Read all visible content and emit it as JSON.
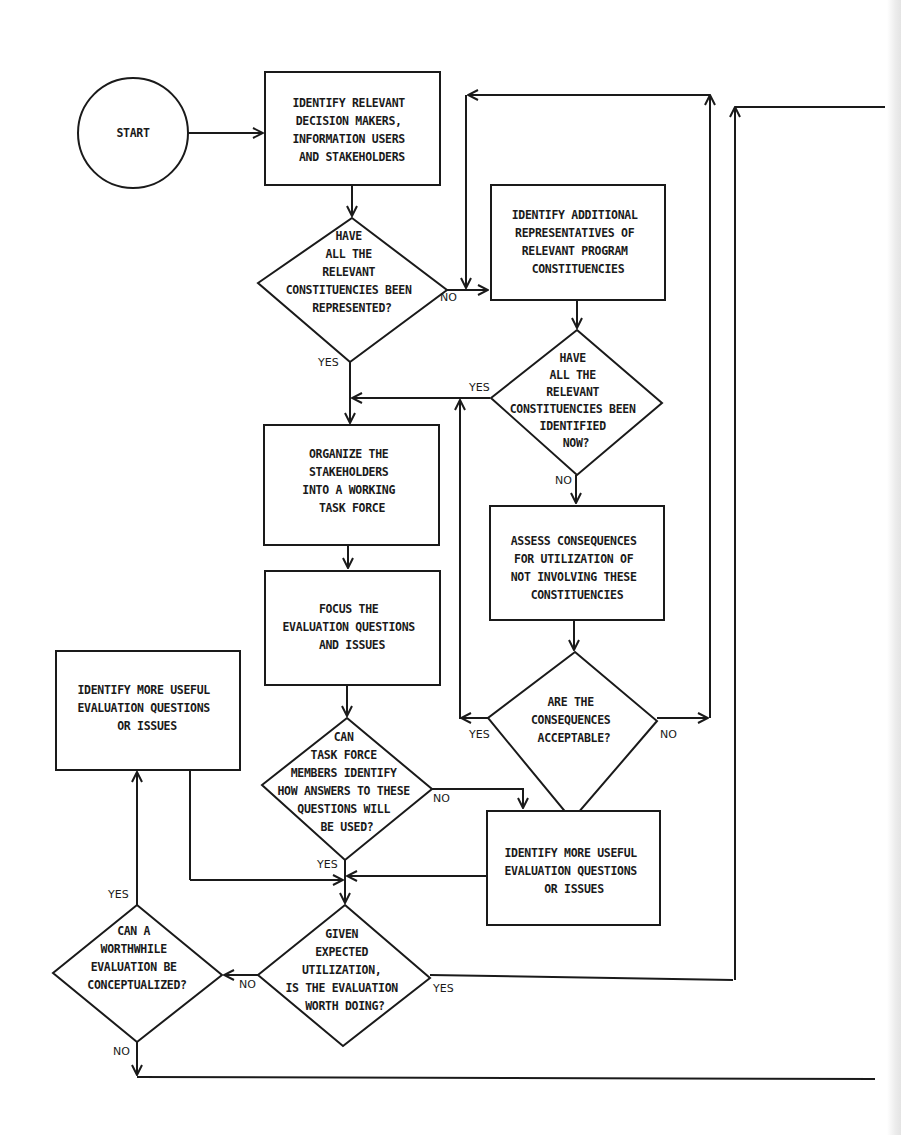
{
  "diagram": {
    "type": "flowchart",
    "colors": {
      "stroke": "#1a1a1a",
      "background": "#ffffff"
    },
    "nodes": {
      "start": {
        "shape": "circle",
        "lines": [
          "START"
        ]
      },
      "identify_stakeholders": {
        "shape": "box",
        "lines": [
          "IDENTIFY RELEVANT",
          "DECISION MAKERS,",
          "INFORMATION USERS",
          "AND STAKEHOLDERS"
        ]
      },
      "all_represented": {
        "shape": "diamond",
        "lines": [
          "HAVE",
          "ALL THE",
          "RELEVANT",
          "CONSTITUENCIES BEEN",
          "REPRESENTED?"
        ]
      },
      "identify_additional": {
        "shape": "box",
        "lines": [
          "IDENTIFY ADDITIONAL",
          "REPRESENTATIVES OF",
          "RELEVANT PROGRAM",
          "CONSTITUENCIES"
        ]
      },
      "all_identified": {
        "shape": "diamond",
        "lines": [
          "HAVE",
          "ALL THE",
          "RELEVANT",
          "CONSTITUENCIES BEEN",
          "IDENTIFIED",
          "NOW?"
        ]
      },
      "assess_consequences": {
        "shape": "box",
        "lines": [
          "ASSESS CONSEQUENCES",
          "FOR UTILIZATION OF",
          "NOT INVOLVING THESE",
          "CONSTITUENCIES"
        ]
      },
      "consequences_acceptable": {
        "shape": "diamond",
        "lines": [
          "ARE THE",
          "CONSEQUENCES",
          "ACCEPTABLE?"
        ]
      },
      "organize_task_force": {
        "shape": "box",
        "lines": [
          "ORGANIZE THE",
          "STAKEHOLDERS",
          "INTO A WORKING",
          "TASK FORCE"
        ]
      },
      "focus_questions": {
        "shape": "box",
        "lines": [
          "FOCUS THE",
          "EVALUATION QUESTIONS",
          "AND ISSUES"
        ]
      },
      "members_identify_use": {
        "shape": "diamond",
        "lines": [
          "CAN",
          "TASK FORCE",
          "MEMBERS IDENTIFY",
          "HOW ANSWERS TO THESE",
          "QUESTIONS WILL",
          "BE USED?"
        ]
      },
      "more_useful_questions_right": {
        "shape": "box",
        "lines": [
          "IDENTIFY MORE USEFUL",
          "EVALUATION QUESTIONS",
          "OR ISSUES"
        ]
      },
      "more_useful_questions_left": {
        "shape": "box",
        "lines": [
          "IDENTIFY MORE USEFUL",
          "EVALUATION QUESTIONS",
          "OR ISSUES"
        ]
      },
      "worth_doing": {
        "shape": "diamond",
        "lines": [
          "GIVEN",
          "EXPECTED",
          "UTILIZATION,",
          "IS THE EVALUATION",
          "WORTH DOING?"
        ]
      },
      "can_conceptualize": {
        "shape": "diamond",
        "lines": [
          "CAN A",
          "WORTHWHILE",
          "EVALUATION BE",
          "CONCEPTUALIZED?"
        ]
      }
    },
    "edge_labels": {
      "all_represented_no": "NO",
      "all_represented_yes": "YES",
      "all_identified_yes": "YES",
      "all_identified_no": "NO",
      "consequences_yes": "YES",
      "consequences_no": "NO",
      "members_no": "NO",
      "members_yes": "YES",
      "worth_no": "NO",
      "worth_yes": "YES",
      "conceptualize_yes": "YES",
      "conceptualize_no": "NO"
    }
  }
}
